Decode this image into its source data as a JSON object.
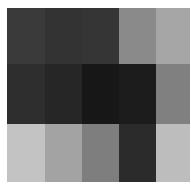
{
  "image": {
    "description": "Grayscale block mosaic, 5 columns by 3 rows",
    "rows": 3,
    "cols": 5,
    "cells": [
      [
        "#3a3a3a",
        "#333333",
        "#353535",
        "#8a8a8a",
        "#a6a6a6"
      ],
      [
        "#2e2e2e",
        "#262626",
        "#171717",
        "#1c1c1c",
        "#808080"
      ],
      [
        "#c3c3c3",
        "#a3a3a3",
        "#7e7e7e",
        "#2b2b2b",
        "#bdbdbd"
      ]
    ]
  }
}
